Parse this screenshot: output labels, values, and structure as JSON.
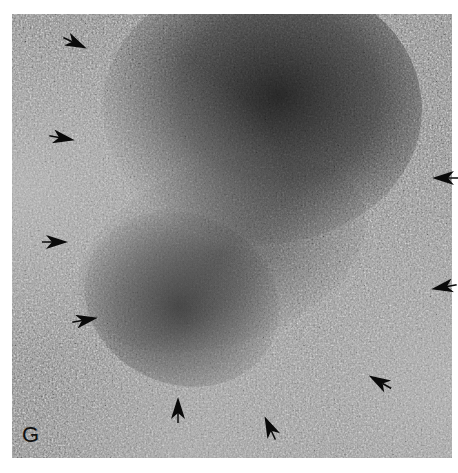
{
  "figure": {
    "panel_label": "G",
    "colors": {
      "background": "#8f8f8f",
      "dark_region": "#1e1e1e",
      "arrows": "#0a0a0a",
      "page": "#ffffff"
    },
    "arrows": [
      {
        "x": 75,
        "y": 43,
        "angle": 25
      },
      {
        "x": 62,
        "y": 138,
        "angle": 10
      },
      {
        "x": 55,
        "y": 242,
        "angle": 0
      },
      {
        "x": 85,
        "y": 320,
        "angle": -10
      },
      {
        "x": 178,
        "y": 410,
        "angle": -90
      },
      {
        "x": 270,
        "y": 428,
        "angle": -115
      },
      {
        "x": 380,
        "y": 382,
        "angle": -150
      },
      {
        "x": 445,
        "y": 178,
        "angle": 180
      },
      {
        "x": 444,
        "y": 287,
        "angle": 170
      }
    ]
  }
}
